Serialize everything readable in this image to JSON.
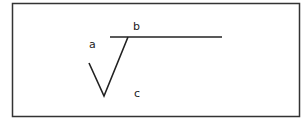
{
  "diagram": {
    "frame": {
      "x": 12,
      "y": 3,
      "width": 287,
      "height": 113,
      "stroke": "#333333"
    },
    "lines": [
      {
        "id": "horizontal",
        "x1": 110,
        "y1": 37,
        "x2": 222,
        "y2": 37
      },
      {
        "id": "v-left",
        "x1": 89,
        "y1": 63,
        "x2": 104,
        "y2": 96
      },
      {
        "id": "v-right",
        "x1": 104,
        "y1": 96,
        "x2": 128,
        "y2": 37
      }
    ],
    "labels": {
      "a": "a",
      "b": "b",
      "c": "c"
    },
    "line_color": "#222222"
  }
}
